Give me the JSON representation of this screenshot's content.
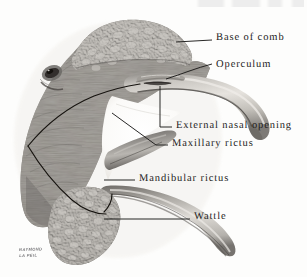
{
  "plate": {
    "subject": "Lateral view of a fowl head showing beak, comb, rictus and wattle",
    "background_color": "#fdfdfc",
    "ink_color": "#1c1b1a",
    "signature_line_1": "RAYMOND",
    "signature_line_2": "LA PEIL"
  },
  "labels": [
    {
      "id": "base-of-comb",
      "text": "Base of comb"
    },
    {
      "id": "operculum",
      "text": "Operculum"
    },
    {
      "id": "external-nasal-opening",
      "text": "External nasal opening"
    },
    {
      "id": "maxillary-rictus",
      "text": "Maxillary rictus"
    },
    {
      "id": "mandibular-rictus",
      "text": "Mandibular rictus"
    },
    {
      "id": "wattle",
      "text": "Wattle"
    }
  ]
}
